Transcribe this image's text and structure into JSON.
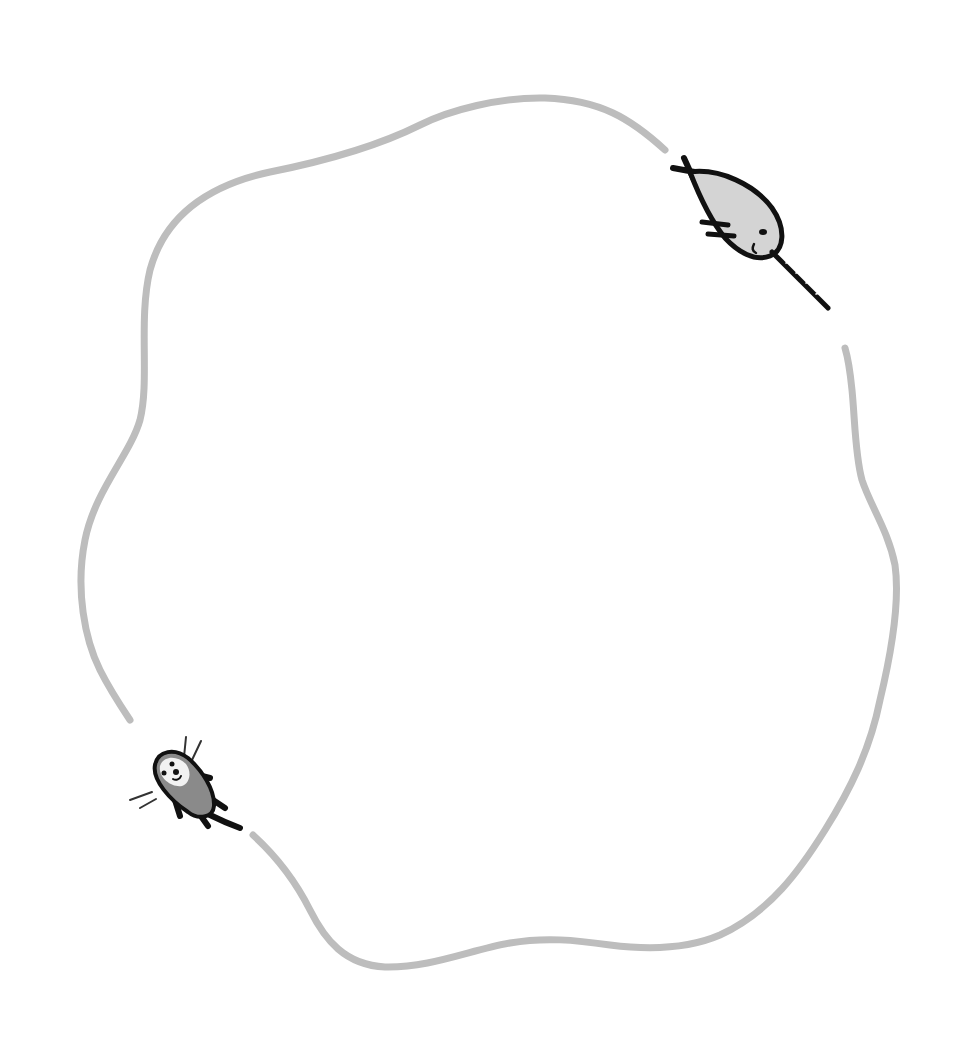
{
  "illustration": {
    "description": "Hand-drawn wavy gray loop with a narwhal at upper right and a sea otter at lower left",
    "background_color": "#ffffff",
    "outline_color": "#bdbdbd",
    "ink_color": "#111111",
    "narwhal_fill": "#d4d4d4",
    "otter_fill": "#8a8a8a",
    "otter_face_fill": "#f2f2f2",
    "characters": [
      {
        "name": "narwhal",
        "position": "upper-right"
      },
      {
        "name": "sea-otter",
        "position": "lower-left"
      }
    ]
  }
}
